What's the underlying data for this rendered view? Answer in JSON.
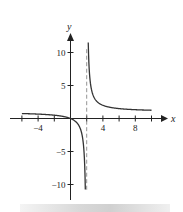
{
  "chart_data": {
    "type": "line",
    "title": "",
    "xlabel": "x",
    "ylabel": "y",
    "function": "y = x / (x - 2)",
    "xlim": [
      -7,
      11
    ],
    "ylim": [
      -12,
      12
    ],
    "x_ticks": [
      -6,
      -4,
      -2,
      2,
      4,
      6,
      8,
      10
    ],
    "x_tick_labels": [
      {
        "value": -4,
        "label": "−4"
      },
      {
        "value": 4,
        "label": "4"
      },
      {
        "value": 8,
        "label": "8"
      }
    ],
    "y_ticks": [
      10,
      5,
      -5,
      -10
    ],
    "y_tick_labels": [
      {
        "value": 10,
        "label": "10"
      },
      {
        "value": 5,
        "label": "5"
      },
      {
        "value": -5,
        "label": "−5"
      },
      {
        "value": -10,
        "label": "−10"
      }
    ],
    "vertical_asymptote": 2,
    "horizontal_asymptote": 1,
    "series": [
      {
        "name": "left branch",
        "x": [
          -6,
          -4,
          -2,
          0,
          1,
          1.5,
          1.8,
          1.83
        ],
        "y": [
          0.75,
          0.67,
          0.5,
          0,
          -1,
          -3,
          -9,
          -10.8
        ]
      },
      {
        "name": "right branch",
        "x": [
          2.18,
          2.2,
          2.5,
          3,
          4,
          6,
          8,
          10
        ],
        "y": [
          13.1,
          12,
          5,
          3,
          2,
          1.5,
          1.33,
          1.25
        ]
      }
    ],
    "grid": false,
    "legend": null
  },
  "labels": {
    "x_axis": "x",
    "y_axis": "y"
  }
}
